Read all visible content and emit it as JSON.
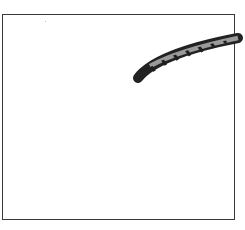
{
  "canvas": {
    "background": "#ffffff",
    "border_color": "#3a3a3a"
  },
  "brush_stroke": {
    "type": "patterned-brush-stroke",
    "outline_color": "#222222",
    "fill_color": "#9a9a9a",
    "hatch_color": "#1e1e1e"
  }
}
